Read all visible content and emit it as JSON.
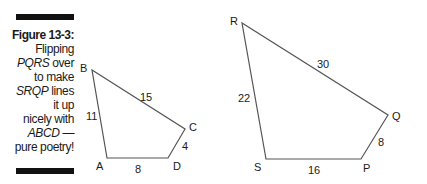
{
  "caption": {
    "figure_label": "Figure 13-3:",
    "line1": "Flipping",
    "line2_italic": "PQRS",
    "line2_rest": " over",
    "line3": "to make",
    "line4_italic": "SRQP",
    "line4_rest": " lines",
    "line5": "it up",
    "line6": "nicely with",
    "line7_italic": "ABCD",
    "line7_rest": " —",
    "line8": "pure poetry!"
  },
  "quadrilateral_abcd": {
    "vertices": {
      "A": {
        "label": "A",
        "x": 107,
        "y": 158
      },
      "B": {
        "label": "B",
        "x": 92,
        "y": 70
      },
      "C": {
        "label": "C",
        "x": 185,
        "y": 129
      },
      "D": {
        "label": "D",
        "x": 168,
        "y": 158
      }
    },
    "sides": {
      "AB": "11",
      "BC": "15",
      "CD": "4",
      "DA": "8"
    }
  },
  "quadrilateral_pqrs": {
    "vertices": {
      "P": {
        "label": "P",
        "x": 361,
        "y": 159
      },
      "Q": {
        "label": "Q",
        "x": 388,
        "y": 115
      },
      "R": {
        "label": "R",
        "x": 242,
        "y": 23
      },
      "S": {
        "label": "S",
        "x": 266,
        "y": 159
      }
    },
    "sides": {
      "SR": "22",
      "RQ": "30",
      "QP": "8",
      "PS": "16"
    }
  },
  "colors": {
    "stroke": "#555555",
    "text": "#1a1a1a",
    "bar": "#111111"
  }
}
